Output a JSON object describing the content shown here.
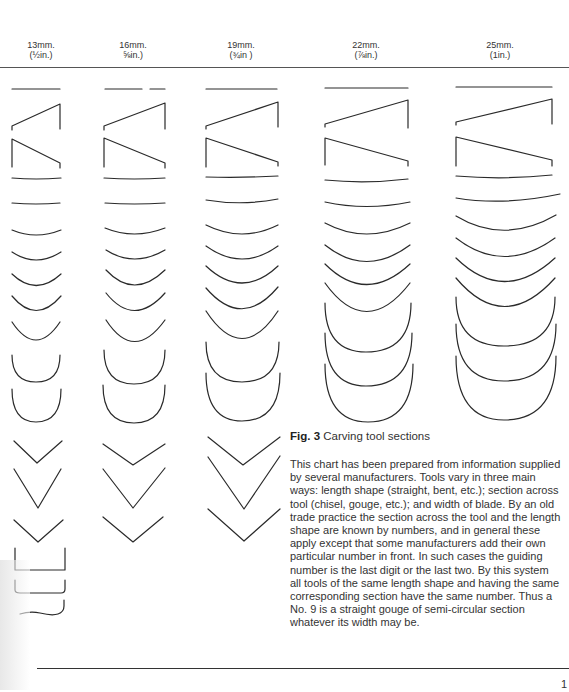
{
  "figure": {
    "label": "Fig. 3",
    "title": "Carving tool sections"
  },
  "columns": [
    {
      "mm": "13mm.",
      "inch": "(½in.)"
    },
    {
      "mm": "16mm.",
      "inch": "⅝in.)"
    },
    {
      "mm": "19mm.",
      "inch": "(¾in )"
    },
    {
      "mm": "22mm.",
      "inch": "(⅞in.)"
    },
    {
      "mm": "25mm.",
      "inch": "(1in.)"
    }
  ],
  "section_rows": [
    "flat chisel",
    "skew chisel (left)",
    "skew chisel (right)",
    "sweep 3",
    "sweep 4",
    "sweep 5",
    "sweep 6",
    "sweep 7",
    "sweep 8",
    "sweep 9",
    "sweep 10",
    "sweep 11",
    "V-tool 60°",
    "V-tool 45°",
    "V-tool 90°",
    "square fluter",
    "rounded fluter",
    "veiner / wave"
  ],
  "text": {
    "paragraph": "This chart has been prepared from information supplied by several manufacturers. Tools vary in three main ways: length shape (straight, bent, etc.); section across tool (chisel, gouge, etc.); and width of blade. By an old trade practice the section across the tool and the length shape are known by numbers, and in general these apply except that some manufacturers add their own particular number in front. In such cases the guiding number is the last digit or the last two. By this system all tools of the same length shape and having the same corresponding section have the same number. Thus a No. 9 is a straight gouge of semi-circular section whatever its width may be."
  },
  "page": {
    "number": "1"
  },
  "colors": {
    "ink": "#2a2a2a",
    "paper": "#ffffff"
  }
}
